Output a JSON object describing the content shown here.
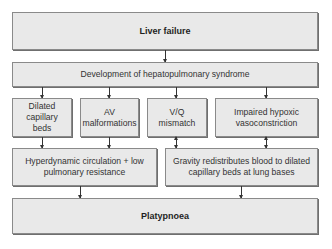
{
  "diagram": {
    "type": "flowchart",
    "nodes": {
      "liver_failure": "Liver failure",
      "hps": "Development of hepatopulmonary syndrome",
      "dilated": "Dilated capillary beds",
      "av": "AV malformations",
      "vq": "V/Q mismatch",
      "hypoxic": "Impaired hypoxic vasoconstriction",
      "hyperdynamic": "Hyperdynamic circulation + low pulmonary resistance",
      "gravity": "Gravity redistributes blood to dilated capillary beds at lung bases",
      "platypnoea": "Platypnoea"
    },
    "edges": [
      [
        "liver_failure",
        "hps"
      ],
      [
        "hps",
        "dilated"
      ],
      [
        "hps",
        "av"
      ],
      [
        "hps",
        "vq"
      ],
      [
        "hps",
        "hypoxic"
      ],
      [
        "dilated",
        "hyperdynamic"
      ],
      [
        "av",
        "hyperdynamic"
      ],
      [
        "vq",
        "gravity"
      ],
      [
        "hypoxic",
        "gravity"
      ],
      [
        "hyperdynamic",
        "platypnoea"
      ],
      [
        "gravity",
        "platypnoea"
      ]
    ],
    "colors": {
      "box_fill": "#e9e9e9",
      "box_border": "#8a8a8a",
      "arrow": "#333333"
    }
  }
}
